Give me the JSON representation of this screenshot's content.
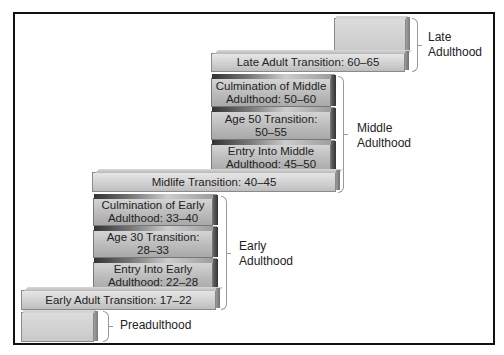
{
  "diagram": {
    "eras": [
      {
        "id": "late",
        "label": "Late Adulthood"
      },
      {
        "id": "middle",
        "label": "Middle Adulthood"
      },
      {
        "id": "early",
        "label": "Early Adulthood"
      },
      {
        "id": "pre",
        "label": "Preadulthood"
      }
    ],
    "stages": [
      {
        "id": "late_adult_transition",
        "label": "Late Adult Transition: 60–65"
      },
      {
        "id": "culmination_middle",
        "label": "Culmination of Middle Adulthood: 50–60",
        "line1": "Culmination of Middle",
        "line2": "Adulthood: 50–60"
      },
      {
        "id": "age50",
        "label": "Age 50 Transition: 50–55",
        "line1": "Age 50 Transition:",
        "line2": "50–55"
      },
      {
        "id": "entry_middle",
        "label": "Entry Into Middle Adulthood: 45–50",
        "line1": "Entry Into Middle",
        "line2": "Adulthood: 45–50"
      },
      {
        "id": "midlife_transition",
        "label": "Midlife Transition: 40–45"
      },
      {
        "id": "culmination_early",
        "label": "Culmination of Early Adulthood: 33–40",
        "line1": "Culmination of Early",
        "line2": "Adulthood: 33–40"
      },
      {
        "id": "age30",
        "label": "Age 30 Transition: 28–33",
        "line1": "Age 30 Transition:",
        "line2": "28–33"
      },
      {
        "id": "entry_early",
        "label": "Entry Into Early Adulthood: 22–28",
        "line1": "Entry Into Early",
        "line2": "Adulthood: 22–28"
      },
      {
        "id": "early_adult_transition",
        "label": "Early Adult Transition: 17–22"
      }
    ],
    "era_labels": {
      "late_line1": "Late",
      "late_line2": "Adulthood",
      "middle_line1": "Middle",
      "middle_line2": "Adulthood",
      "early_line1": "Early",
      "early_line2": "Adulthood",
      "pre": "Preadulthood"
    }
  }
}
